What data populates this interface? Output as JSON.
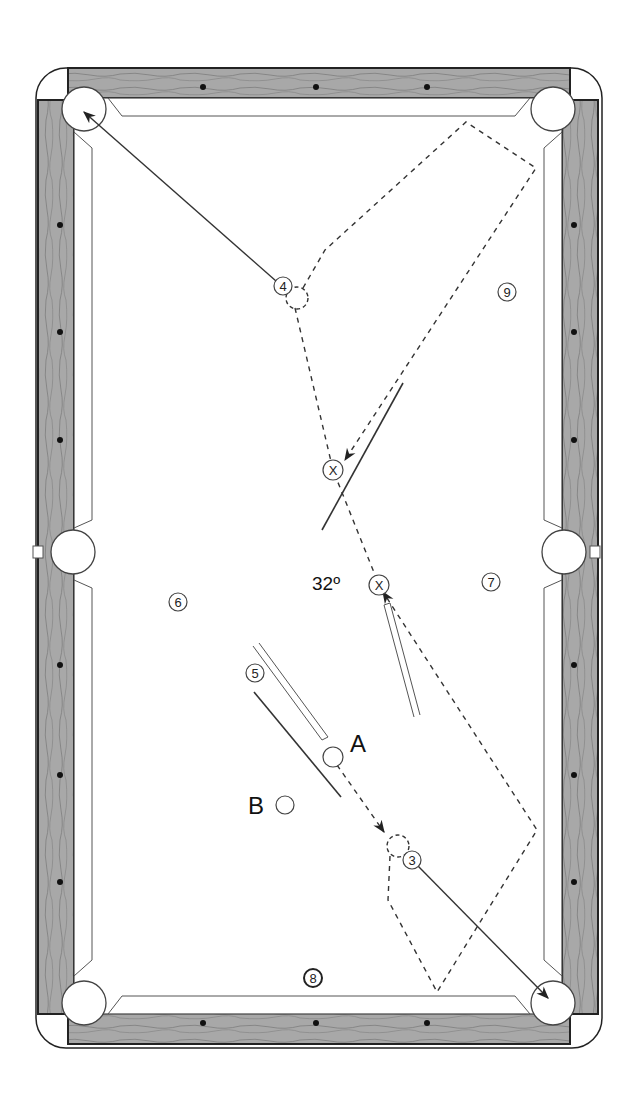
{
  "diagram": {
    "type": "billiards-table-shot-diagram",
    "colors": {
      "rail": "#a9a9a9",
      "rail_outline": "#222222",
      "cloth": "#ffffff",
      "line": "#333333",
      "diamond": "#111111"
    },
    "labels": {
      "cue_ball_A": "A",
      "ghost_ball_B": "B",
      "angle": "32º",
      "x_marker": "X"
    },
    "balls": [
      {
        "id": "4",
        "label": "4",
        "x": 283,
        "y": 286
      },
      {
        "id": "9",
        "label": "9",
        "x": 507,
        "y": 292
      },
      {
        "id": "6",
        "label": "6",
        "x": 178,
        "y": 602
      },
      {
        "id": "7",
        "label": "7",
        "x": 491,
        "y": 582
      },
      {
        "id": "5",
        "label": "5",
        "x": 255,
        "y": 673
      },
      {
        "id": "3",
        "label": "3",
        "x": 412,
        "y": 860
      },
      {
        "id": "8",
        "label": "8",
        "x": 313,
        "y": 978
      }
    ],
    "markers": [
      {
        "label": "X",
        "x": 333,
        "y": 470
      },
      {
        "label": "X",
        "x": 379,
        "y": 585
      }
    ],
    "cue_ball": {
      "label": "A",
      "x": 333,
      "y": 757
    },
    "object_position": {
      "label": "B",
      "x": 285,
      "y": 805
    },
    "pockets": [
      "top-left",
      "top-right",
      "side-left",
      "side-right",
      "bottom-left",
      "bottom-right"
    ]
  }
}
